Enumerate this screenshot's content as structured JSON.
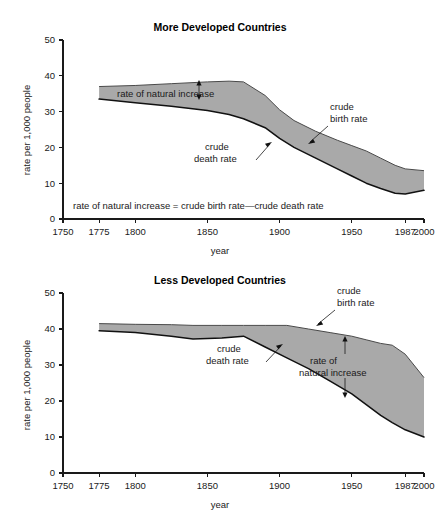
{
  "figure": {
    "background": "#ffffff",
    "band_color": "#a9a9a9",
    "line_color": "#111111"
  },
  "axis": {
    "ylabel": "rate per 1,000 people",
    "xlabel": "year",
    "ytick_labels": [
      "0",
      "10",
      "20",
      "30",
      "40",
      "50"
    ],
    "xtick_labels": [
      "1750",
      "1775",
      "1800",
      "1850",
      "1900",
      "1950",
      "1987",
      "2000"
    ]
  },
  "equation": "rate of natural increase = crude birth rate—crude death rate",
  "labels": {
    "crude_birth_rate_line1": "crude",
    "crude_birth_rate_line2": "birth rate",
    "crude_death_rate_line1": "crude",
    "crude_death_rate_line2": "death rate",
    "rate_natural_increase": "rate of natural increase",
    "rate_natural_increase_line1": "rate of",
    "rate_natural_increase_line2": "natural increase"
  },
  "chart_data": [
    {
      "type": "area",
      "title": "More Developed Countries",
      "xlabel": "year",
      "ylabel": "rate per 1,000 people",
      "xlim": [
        1750,
        2000
      ],
      "ylim": [
        0,
        50
      ],
      "xticks": [
        1750,
        1775,
        1800,
        1850,
        1900,
        1950,
        1987,
        2000
      ],
      "yticks": [
        0,
        10,
        20,
        30,
        40,
        50
      ],
      "grid": false,
      "legend": "annotations",
      "series": [
        {
          "name": "crude birth rate",
          "x": [
            1775,
            1800,
            1825,
            1850,
            1865,
            1875,
            1890,
            1900,
            1910,
            1925,
            1940,
            1950,
            1960,
            1970,
            1980,
            1987,
            2000
          ],
          "values": [
            37.0,
            37.3,
            37.8,
            38.3,
            38.5,
            38.3,
            34.5,
            30.5,
            27.5,
            24.5,
            22.0,
            20.5,
            19.0,
            17.0,
            15.0,
            14.0,
            13.5
          ]
        },
        {
          "name": "crude death rate",
          "x": [
            1775,
            1800,
            1825,
            1850,
            1865,
            1875,
            1890,
            1900,
            1910,
            1925,
            1940,
            1950,
            1960,
            1970,
            1980,
            1987,
            2000
          ],
          "values": [
            33.5,
            32.5,
            31.5,
            30.3,
            29.2,
            28.0,
            25.5,
            22.5,
            20.0,
            17.0,
            14.0,
            12.0,
            10.0,
            8.5,
            7.2,
            7.0,
            8.0
          ]
        }
      ],
      "annotations": [
        {
          "text": "rate of natural increase",
          "kind": "double-arrow"
        },
        {
          "text": "crude birth rate",
          "kind": "leader"
        },
        {
          "text": "crude death rate",
          "kind": "leader"
        },
        {
          "text": "rate of natural increase = crude birth rate—crude death rate",
          "kind": "equation"
        }
      ]
    },
    {
      "type": "area",
      "title": "Less Developed Countries",
      "xlabel": "year",
      "ylabel": "rate per 1,000 people",
      "xlim": [
        1750,
        2000
      ],
      "ylim": [
        0,
        50
      ],
      "xticks": [
        1750,
        1775,
        1800,
        1850,
        1900,
        1950,
        1987,
        2000
      ],
      "yticks": [
        0,
        10,
        20,
        30,
        40,
        50
      ],
      "grid": false,
      "legend": "annotations",
      "series": [
        {
          "name": "crude birth rate",
          "x": [
            1775,
            1800,
            1825,
            1840,
            1860,
            1875,
            1890,
            1905,
            1920,
            1935,
            1950,
            1960,
            1970,
            1978,
            1987,
            2000
          ],
          "values": [
            41.5,
            41.3,
            41.2,
            41.0,
            41.0,
            41.0,
            41.0,
            41.0,
            40.0,
            39.0,
            38.0,
            37.0,
            36.0,
            35.5,
            33.0,
            26.5
          ]
        },
        {
          "name": "crude death rate",
          "x": [
            1775,
            1800,
            1825,
            1840,
            1860,
            1875,
            1890,
            1905,
            1920,
            1935,
            1950,
            1960,
            1970,
            1978,
            1987,
            2000
          ],
          "values": [
            39.5,
            39.0,
            38.0,
            37.2,
            37.5,
            38.0,
            35.0,
            32.0,
            29.0,
            25.5,
            22.0,
            19.0,
            16.0,
            14.0,
            12.0,
            10.0
          ]
        }
      ],
      "annotations": [
        {
          "text": "crude birth rate",
          "kind": "leader"
        },
        {
          "text": "crude death rate",
          "kind": "leader"
        },
        {
          "text": "rate of natural increase",
          "kind": "double-arrow"
        }
      ]
    }
  ]
}
